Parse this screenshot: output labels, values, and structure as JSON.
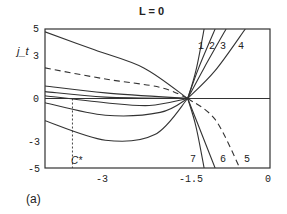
{
  "chart_data": {
    "type": "line",
    "title": "L = 0",
    "xlabel": "",
    "ylabel": "j_t",
    "panel_label": "(a)",
    "xlim": [
      -4.1,
      0
    ],
    "ylim": [
      -5,
      5
    ],
    "x_ticks": [
      "-3",
      "-1.5",
      "0"
    ],
    "y_ticks": [
      "5",
      "3",
      "0",
      "-3",
      "-5"
    ],
    "grid": false,
    "focal_point": {
      "x": -1.5,
      "y": 0
    },
    "vertical_marker": {
      "label": "C*",
      "x": -3.6,
      "style": "dashed"
    },
    "horizontal_line": {
      "y": 0
    },
    "curve_labels": [
      "1",
      "2",
      "3",
      "4",
      "5",
      "6",
      "7"
    ],
    "series": [
      {
        "name": "1",
        "style": "solid",
        "points": [
          [
            -1.5,
            0
          ],
          [
            -1.35,
            2.0
          ],
          [
            -1.2,
            5
          ]
        ]
      },
      {
        "name": "2",
        "style": "solid",
        "points": [
          [
            -1.5,
            0
          ],
          [
            -1.3,
            2.2
          ],
          [
            -1.0,
            5
          ]
        ]
      },
      {
        "name": "3",
        "style": "solid",
        "points": [
          [
            -1.5,
            0
          ],
          [
            -1.2,
            2.2
          ],
          [
            -0.8,
            5
          ]
        ]
      },
      {
        "name": "4",
        "style": "solid",
        "points": [
          [
            -1.5,
            0
          ],
          [
            -1.0,
            2.0
          ],
          [
            -0.45,
            5
          ]
        ]
      },
      {
        "name": "5",
        "style": "dashed",
        "points": [
          [
            -1.5,
            0
          ],
          [
            -1.0,
            -1.5
          ],
          [
            -0.55,
            -5
          ]
        ]
      },
      {
        "name": "6",
        "style": "solid",
        "points": [
          [
            -1.5,
            0
          ],
          [
            -1.3,
            -2.0
          ],
          [
            -1.0,
            -5
          ]
        ]
      },
      {
        "name": "7",
        "style": "solid",
        "points": [
          [
            -1.5,
            0
          ],
          [
            -1.35,
            -2.0
          ],
          [
            -1.2,
            -5
          ]
        ]
      },
      {
        "name": "upper-left-solid",
        "style": "solid",
        "points": [
          [
            -4.1,
            4.8
          ],
          [
            -3.2,
            3.5
          ],
          [
            -2.3,
            2.2
          ],
          [
            -1.5,
            0
          ]
        ]
      },
      {
        "name": "upper-left-dashed",
        "style": "dashed",
        "points": [
          [
            -4.1,
            2.2
          ],
          [
            -3.0,
            1.4
          ],
          [
            -2.0,
            0.8
          ],
          [
            -1.5,
            0
          ]
        ]
      },
      {
        "name": "near-zero-1",
        "style": "solid",
        "points": [
          [
            -4.1,
            0.9
          ],
          [
            -3.0,
            0.4
          ],
          [
            -1.5,
            0
          ]
        ]
      },
      {
        "name": "near-zero-2",
        "style": "solid",
        "points": [
          [
            -4.1,
            0.5
          ],
          [
            -3.0,
            0.1
          ],
          [
            -1.5,
            0
          ]
        ]
      },
      {
        "name": "near-zero-3",
        "style": "solid",
        "points": [
          [
            -4.1,
            0.2
          ],
          [
            -3.0,
            -0.3
          ],
          [
            -2.2,
            -0.5
          ],
          [
            -1.5,
            0
          ]
        ]
      },
      {
        "name": "below-1",
        "style": "solid",
        "points": [
          [
            -4.1,
            -0.3
          ],
          [
            -3.0,
            -1.2
          ],
          [
            -2.0,
            -1.0
          ],
          [
            -1.5,
            0
          ]
        ]
      },
      {
        "name": "below-2",
        "style": "solid",
        "points": [
          [
            -4.1,
            -1.6
          ],
          [
            -3.0,
            -3.0
          ],
          [
            -2.1,
            -2.6
          ],
          [
            -1.5,
            0
          ]
        ]
      }
    ]
  }
}
